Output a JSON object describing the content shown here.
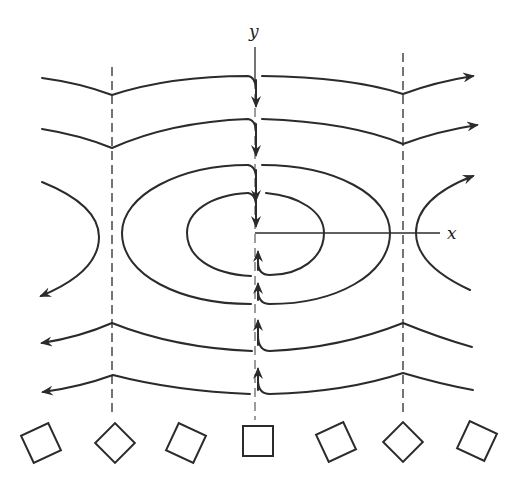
{
  "figure": {
    "axes": {
      "x_label": "x",
      "y_label": "y"
    },
    "colors": {
      "ink": "#2b2b2b",
      "background": "#ffffff"
    },
    "dashed_lines": [
      {
        "name": "left-dashed-line",
        "x": 112
      },
      {
        "name": "right-dashed-line",
        "x": 403
      }
    ],
    "streamlines": {
      "upper_open_lines": 2,
      "closed_ellipses": 2,
      "side_hyperbolas": 2,
      "lower_open_lines": 2
    },
    "squares": {
      "count": 7,
      "rotations_deg": [
        -25,
        45,
        25,
        0,
        -25,
        45,
        25
      ]
    }
  }
}
